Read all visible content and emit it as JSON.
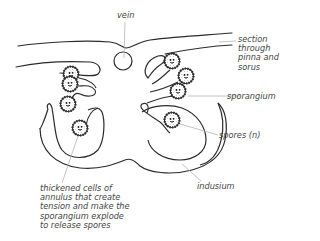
{
  "diagram": {
    "labels": {
      "vein": "vein",
      "section": "section\nthrough\npinna and\nsorus",
      "sporangium": "sporangium",
      "spores": "spores (n)",
      "indusium": "indusium",
      "annulus": "thickened cells of\nannulus that create\ntension and make the\nsporangium explode\nto release spores"
    },
    "colors": {
      "outline": "#2b2b2b",
      "leader_line": "#b5b5b5",
      "label_text": "#444444"
    }
  }
}
